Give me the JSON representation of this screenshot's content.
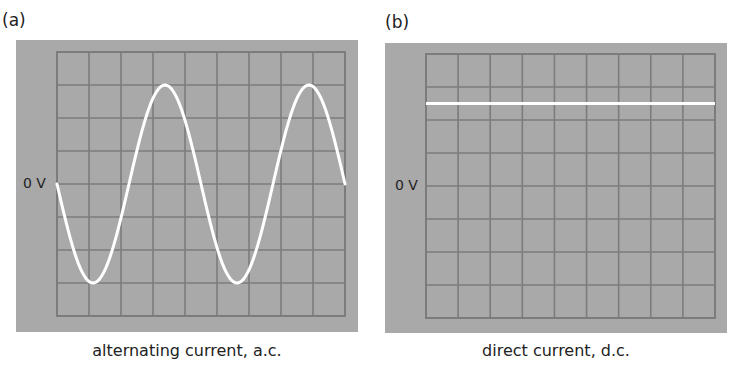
{
  "figure": {
    "panels": [
      {
        "id": "a",
        "label": "(a)",
        "zero_label": "0 V",
        "caption": "alternating current, a.c.",
        "trace": "sine",
        "screen_color": "#a9a9a9",
        "grid_color": "#7c7c7c",
        "trace_color": "#ffffff",
        "grid": {
          "columns": 9,
          "rows": 8
        }
      },
      {
        "id": "b",
        "label": "(b)",
        "zero_label": "0 V",
        "caption": "direct current, d.c.",
        "trace": "constant",
        "screen_color": "#a9a9a9",
        "grid_color": "#7c7c7c",
        "trace_color": "#ffffff",
        "grid": {
          "columns": 9,
          "rows": 8
        }
      }
    ]
  },
  "chart_data": [
    {
      "type": "line",
      "title": "alternating current, a.c.",
      "panel": "(a)",
      "xlabel": "",
      "ylabel": "",
      "y_reference_label": "0 V",
      "grid": true,
      "grid_divisions": {
        "x": 9,
        "y": 8
      },
      "ylim_divisions": [
        -4,
        4
      ],
      "xlim_divisions": [
        0,
        9
      ],
      "series": [
        {
          "name": "a.c. trace",
          "shape": "sine",
          "amplitude_divisions": 3,
          "period_divisions": 4.5,
          "start_phase": "0 V, heading negative",
          "x": [
            0,
            1.125,
            2.25,
            3.375,
            4.5,
            5.625,
            6.75,
            7.875,
            9
          ],
          "y": [
            0,
            -3,
            0,
            3,
            0,
            -3,
            0,
            3,
            0
          ]
        }
      ]
    },
    {
      "type": "line",
      "title": "direct current, d.c.",
      "panel": "(b)",
      "xlabel": "",
      "ylabel": "",
      "y_reference_label": "0 V",
      "grid": true,
      "grid_divisions": {
        "x": 9,
        "y": 8
      },
      "ylim_divisions": [
        -4,
        4
      ],
      "xlim_divisions": [
        0,
        9
      ],
      "series": [
        {
          "name": "d.c. trace",
          "shape": "constant",
          "x": [
            0,
            9
          ],
          "y": [
            2.5,
            2.5
          ]
        }
      ]
    }
  ]
}
